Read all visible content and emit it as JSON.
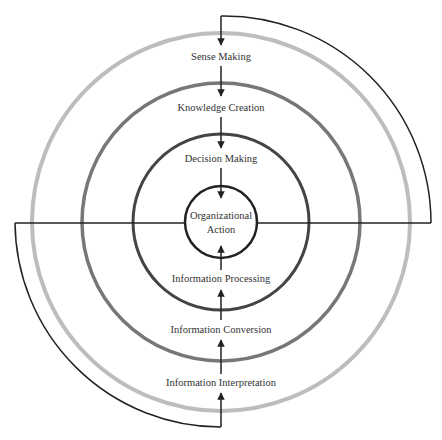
{
  "diagram": {
    "center": {
      "x": 221,
      "y": 222
    },
    "rings": [
      {
        "name": "inner",
        "radius": 36,
        "color": "#222222",
        "width": 2.5
      },
      {
        "name": "decision",
        "radius": 88,
        "color": "#444444",
        "width": 3
      },
      {
        "name": "knowledge",
        "radius": 139,
        "color": "#777777",
        "width": 3.5
      },
      {
        "name": "sense",
        "radius": 189,
        "color": "#bdbdbd",
        "width": 4
      }
    ],
    "center_label": [
      "Organizational",
      "Action"
    ],
    "top_labels": [
      "Sense Making",
      "Knowledge Creation",
      "Decision Making"
    ],
    "bottom_labels": [
      "Information Processing",
      "Information Conversion",
      "Information Interpretation"
    ],
    "line_color": "#222222"
  }
}
